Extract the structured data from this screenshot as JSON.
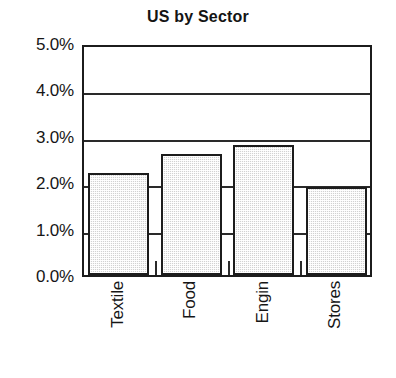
{
  "chart_data": {
    "type": "bar",
    "title": "US by Sector",
    "xlabel": "",
    "ylabel": "",
    "categories": [
      "Textile",
      "Food",
      "Engin",
      "Stores"
    ],
    "values": [
      2.2,
      2.6,
      2.8,
      1.9
    ],
    "value_labels": [
      "2.2%",
      "2.6%",
      "2.8%",
      "1.9%"
    ],
    "ylim": [
      0.0,
      5.0
    ],
    "y_ticks": [
      0.0,
      1.0,
      2.0,
      3.0,
      4.0,
      5.0
    ],
    "y_tick_labels": [
      "0.0%",
      "1.0%",
      "2.0%",
      "3.0%",
      "4.0%",
      "5.0%"
    ],
    "grid": true,
    "grid_axis": "y",
    "legend": false,
    "legend_position": "none",
    "units": "percent",
    "series": [
      {
        "name": "US by Sector",
        "values": [
          2.2,
          2.6,
          2.8,
          1.9
        ]
      }
    ],
    "colors": {
      "bar_fill": "#d2d2d2",
      "bar_border": "#1c1c1c",
      "axis": "#1c1c1c",
      "grid": "#2a2a2a",
      "text": "#161616",
      "background": "#ffffff"
    }
  }
}
